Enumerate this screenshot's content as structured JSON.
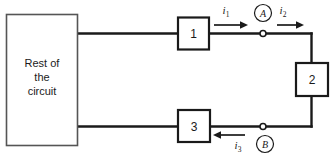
{
  "diagram": {
    "type": "electrical-circuit-schematic",
    "source_box": {
      "label_lines": [
        "Rest of",
        "the",
        "circuit"
      ],
      "full_label": "Rest of the circuit"
    },
    "elements": [
      {
        "id": "element-1",
        "label": "1",
        "position": "top-branch"
      },
      {
        "id": "element-2",
        "label": "2",
        "position": "right-branch"
      },
      {
        "id": "element-3",
        "label": "3",
        "position": "bottom-branch"
      }
    ],
    "currents": [
      {
        "id": "current-i1",
        "symbol": "i",
        "subscript": "1",
        "direction": "right"
      },
      {
        "id": "current-i2",
        "symbol": "i",
        "subscript": "2",
        "direction": "right"
      },
      {
        "id": "current-i3",
        "symbol": "i",
        "subscript": "3",
        "direction": "left"
      }
    ],
    "nodes": [
      {
        "id": "node-a",
        "label": "A",
        "position": "top"
      },
      {
        "id": "node-b",
        "label": "B",
        "position": "bottom"
      }
    ],
    "colors": {
      "wire": "#1a1a1a",
      "box_outline": "#1a1a1a",
      "source_box_outline": "#555555",
      "background": "#ffffff"
    }
  }
}
